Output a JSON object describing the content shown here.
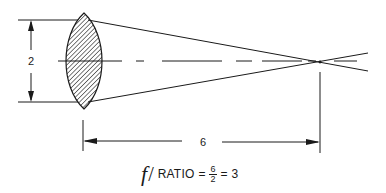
{
  "diagram": {
    "aperture_label": "2",
    "focal_length_label": "6",
    "formula": {
      "symbol": "f",
      "slash": "/",
      "word": "RATIO",
      "equals1": "=",
      "numerator": "6",
      "denominator": "2",
      "equals2": "=",
      "result": "3"
    },
    "colors": {
      "line": "#1a1a1a",
      "background": "#ffffff",
      "hatch": "#333333"
    }
  }
}
